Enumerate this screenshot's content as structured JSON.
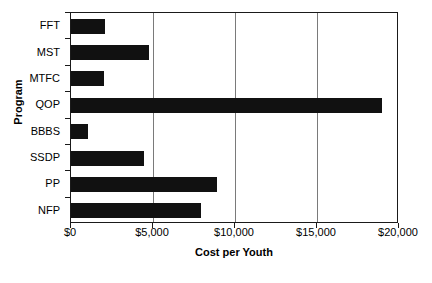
{
  "chart_data": {
    "type": "bar",
    "orientation": "horizontal",
    "title": "",
    "xlabel": "Cost per Youth",
    "ylabel": "Program",
    "categories": [
      "FFT",
      "MST",
      "MTFC",
      "QOP",
      "BBBS",
      "SSDP",
      "PP",
      "NFP"
    ],
    "values": [
      2050,
      4750,
      2000,
      18950,
      1050,
      4450,
      8900,
      7950
    ],
    "xlim": [
      0,
      20000
    ],
    "xticks": [
      0,
      5000,
      10000,
      15000,
      20000
    ],
    "xtick_labels": [
      "$0",
      "$5,000",
      "$10,000",
      "$15,000",
      "$20,000"
    ],
    "grid": "vertical",
    "legend": "none",
    "bar_color": "#111111",
    "frame_color": "#1a1a1a",
    "gridline_color": "#7a7a7a"
  },
  "figure": {
    "caption_fragment": ""
  }
}
